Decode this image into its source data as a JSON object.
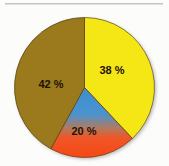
{
  "page": {
    "background_color": "#fcfcfb",
    "divider_color": "#c4c4c4"
  },
  "chart_data": {
    "type": "pie",
    "title": "",
    "subtitle": "",
    "xlabel": "",
    "ylabel": "",
    "grid": false,
    "legend_position": "none",
    "value_unit": "%",
    "start_angle_deg": 0,
    "direction": "clockwise",
    "center": {
      "x": 84.5,
      "y": 87.5
    },
    "radius": 70,
    "categories": [
      "Yellow segment",
      "Red segment",
      "Brown segment"
    ],
    "values": [
      38,
      20,
      42
    ],
    "labels": [
      "38 %",
      "20 %",
      "42 %"
    ],
    "colors": [
      "#f5e617",
      "#f54a14",
      "#9a7a1e"
    ],
    "slices": [
      {
        "label": "38 %",
        "value": 38,
        "color": "#f5e617",
        "color_name": "yellow",
        "start_deg": 0,
        "end_deg": 136.8,
        "label_x": 112,
        "label_y": 71
      },
      {
        "label": "20 %",
        "value": 20,
        "color": "#f54a14",
        "color_name": "orange-red",
        "gradient_from": "#3e8fd0",
        "gradient_to": "#f54a14",
        "start_deg": 136.8,
        "end_deg": 208.8,
        "label_x": 84,
        "label_y": 132
      },
      {
        "label": "42 %",
        "value": 42,
        "color": "#9a7a1e",
        "color_name": "olive-brown",
        "start_deg": 208.8,
        "end_deg": 360,
        "label_x": 51,
        "label_y": 85
      }
    ]
  }
}
